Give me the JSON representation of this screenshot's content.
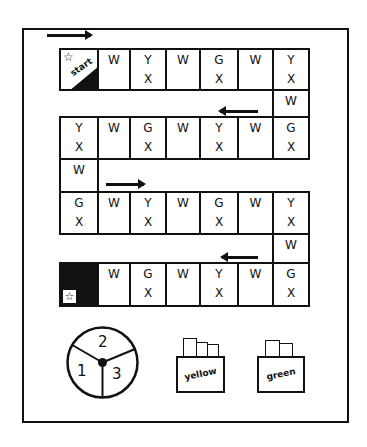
{
  "board": {
    "start_label": "start",
    "row1": [
      {
        "l1": "W",
        "l2": ""
      },
      {
        "l1": "Y",
        "l2": "X"
      },
      {
        "l1": "W",
        "l2": ""
      },
      {
        "l1": "G",
        "l2": "X"
      },
      {
        "l1": "W",
        "l2": ""
      },
      {
        "l1": "Y",
        "l2": "X"
      }
    ],
    "connector1": {
      "l1": "W"
    },
    "row3": [
      {
        "l1": "Y",
        "l2": "X"
      },
      {
        "l1": "W",
        "l2": ""
      },
      {
        "l1": "G",
        "l2": "X"
      },
      {
        "l1": "W",
        "l2": ""
      },
      {
        "l1": "Y",
        "l2": "X"
      },
      {
        "l1": "W",
        "l2": ""
      },
      {
        "l1": "G",
        "l2": "X"
      }
    ],
    "connector2": {
      "l1": "W"
    },
    "row5": [
      {
        "l1": "G",
        "l2": "X"
      },
      {
        "l1": "W",
        "l2": ""
      },
      {
        "l1": "Y",
        "l2": "X"
      },
      {
        "l1": "W",
        "l2": ""
      },
      {
        "l1": "G",
        "l2": "X"
      },
      {
        "l1": "W",
        "l2": ""
      },
      {
        "l1": "Y",
        "l2": "X"
      }
    ],
    "connector3": {
      "l1": "W"
    },
    "row7": [
      {
        "l1": "W",
        "l2": ""
      },
      {
        "l1": "G",
        "l2": "X"
      },
      {
        "l1": "W",
        "l2": ""
      },
      {
        "l1": "Y",
        "l2": "X"
      },
      {
        "l1": "W",
        "l2": ""
      },
      {
        "l1": "G",
        "l2": "X"
      }
    ],
    "star_glyph": "☆"
  },
  "spinner": {
    "sections": [
      "1",
      "2",
      "3"
    ]
  },
  "decks": {
    "yellow": "yellow",
    "green": "green"
  }
}
